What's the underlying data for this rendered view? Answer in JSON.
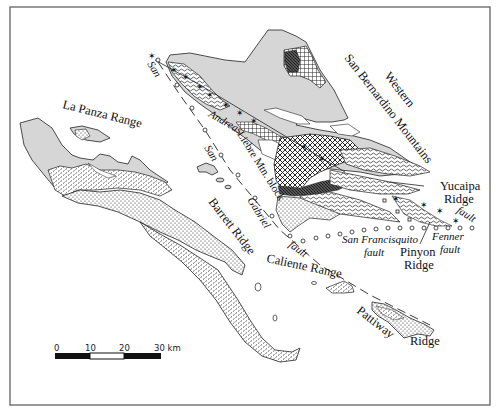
{
  "map": {
    "type": "geologic sketch map",
    "frame": {
      "x": 10,
      "y": 7,
      "width": 480,
      "height": 398
    },
    "labels": {
      "la_panza_range": "La Panza Range",
      "barrett_ridge": "Barrett Ridge",
      "western": "Western",
      "san_bernardino_mountains": "San Bernardino Mountains",
      "yucaipa": "Yucaipa",
      "yucaipa_ridge": "Ridge",
      "pinyon": "Pinyon",
      "pinyon_ridge": "Ridge",
      "caliente_range": "Caliente Range",
      "pattiway": "Pattiway",
      "pattiway_ridge": "Ridge",
      "liebre_mtn_block": "Liebre Mtn. block"
    },
    "faults": {
      "san_andreas_1": "San",
      "san_andreas_2": "Andreas",
      "san_gabriel_1": "San",
      "san_gabriel_2": "Gabriel",
      "san_gabriel_3": "fault",
      "san_francisquito_1": "San Francisquito",
      "san_francisquito_2": "fault",
      "fenner_1": "Fenner",
      "fenner_2": "fault",
      "yucaipa_fault": "fault"
    },
    "symbols": {
      "star": "✶",
      "circle": "o",
      "square": "□"
    },
    "scale_bar": {
      "ticks": [
        "0",
        "10",
        "20",
        "30 km"
      ],
      "segments": [
        "black",
        "white",
        "black"
      ]
    },
    "colors": {
      "land_gray": "#d6d6d6",
      "line": "#222222",
      "frame": "#555555",
      "background": "#ffffff"
    }
  }
}
